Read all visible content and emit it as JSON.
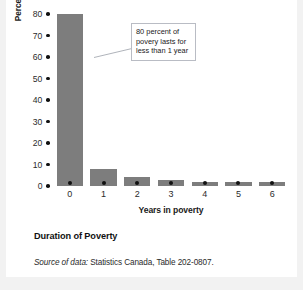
{
  "chart_data": {
    "type": "bar",
    "title": "Duration of Poverty",
    "xlabel": "Years in poverty",
    "ylabel": "Percentage of persons in low income",
    "categories": [
      "0",
      "1",
      "2",
      "3",
      "4",
      "5",
      "6"
    ],
    "values": [
      80,
      8,
      4,
      3,
      2,
      2,
      2
    ],
    "ylim": [
      0,
      80
    ],
    "yticks": [
      80,
      70,
      60,
      50,
      40,
      30,
      20,
      10,
      0
    ],
    "ytick_labels": [
      "80",
      "70",
      "60",
      "50",
      "40",
      "30",
      "20",
      "10",
      "0"
    ],
    "grid": false,
    "legend": false,
    "bar_color": "#7d7d7d",
    "tick_marker_color": "#111111",
    "background": "#ffffff",
    "page_background": "#f2f2f2",
    "annotations": [
      {
        "name": "first-bar-callout",
        "lines": [
          "80 percent of",
          "povery lasts for",
          "less than 1 year"
        ],
        "border_color": "#b9bcc4",
        "fill_color": "#ffffff",
        "points_to_category": "0"
      }
    ]
  },
  "caption": {
    "title": "Duration of Poverty",
    "source_label": "Source of data:",
    "source_text": " Statistics Canada, Table 202-0807."
  }
}
